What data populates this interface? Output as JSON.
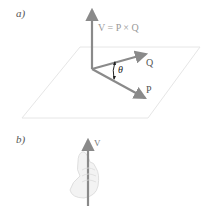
{
  "figure": {
    "part_a": {
      "label": "a)",
      "equation": "V = P × Q",
      "vectors": [
        {
          "name": "V",
          "direction": "up"
        },
        {
          "name": "Q",
          "label": "Q"
        },
        {
          "name": "P",
          "label": "P"
        }
      ],
      "angle_label": "θ",
      "plane": "parallelogram plane containing P and Q"
    },
    "part_b": {
      "label": "b)",
      "vector_label": "V",
      "description": "right-hand rule: hand gripping vertical vector V"
    },
    "colors": {
      "vector": "#8a8a8a",
      "plane": "#e6e6e6",
      "label": "#555555",
      "hand": "#f2f2f2"
    }
  }
}
